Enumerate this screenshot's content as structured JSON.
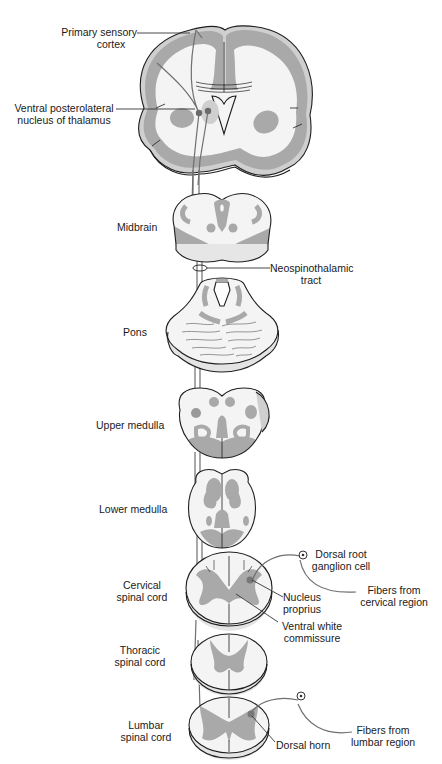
{
  "diagram": {
    "colors": {
      "gray_matter": "#a9a9a9",
      "light_gray": "#cfcfcf",
      "white_matter": "#f4f4f4",
      "outline": "#1e1e1e",
      "tract": "#6f6f6f",
      "nucleus": "#7a7a7a"
    },
    "labels": {
      "primary_sensory_cortex": {
        "line1": "Primary sensory",
        "line2": "cortex"
      },
      "vpl_thalamus": {
        "line1": "Ventral posterolateral",
        "line2": "nucleus of thalamus"
      },
      "midbrain": "Midbrain",
      "neospinothalamic_tract": {
        "line1": "Neospinothalamic",
        "line2": "tract"
      },
      "pons": "Pons",
      "upper_medulla": "Upper medulla",
      "lower_medulla": "Lower medulla",
      "dorsal_root_ganglion": {
        "line1": "Dorsal root",
        "line2": "ganglion cell"
      },
      "fibers_cervical": {
        "line1": "Fibers from",
        "line2": "cervical region"
      },
      "cervical_cord": {
        "line1": "Cervical",
        "line2": "spinal cord"
      },
      "nucleus_proprius": {
        "line1": "Nucleus",
        "line2": "proprius"
      },
      "ventral_white_commissure": {
        "line1": "Ventral white",
        "line2": "commissure"
      },
      "thoracic_cord": {
        "line1": "Thoracic",
        "line2": "spinal cord"
      },
      "lumbar_cord": {
        "line1": "Lumbar",
        "line2": "spinal cord"
      },
      "dorsal_horn": "Dorsal horn",
      "fibers_lumbar": {
        "line1": "Fibers from",
        "line2": "lumbar region"
      }
    }
  }
}
